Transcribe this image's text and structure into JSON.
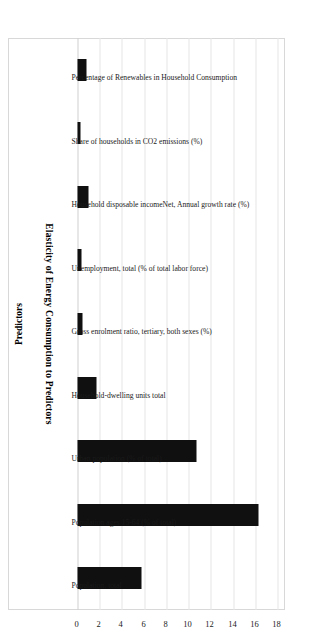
{
  "figure": {
    "caption": "Figure 10-7. Results of the elasticity analysis for Finland."
  },
  "chart_data": {
    "type": "bar",
    "orientation": "vertical-rotated",
    "title": "",
    "xlabel": "Predictors",
    "ylabel": "Elasticity of Energy Consumption  to Predictors",
    "ylim": [
      0,
      18
    ],
    "yticks": [
      0,
      2,
      4,
      6,
      8,
      10,
      12,
      14,
      16,
      18
    ],
    "grid": true,
    "legend": "none",
    "bar_color": "#101010",
    "categories": [
      "Percentage of Renewables in Household Consumption",
      "Share of households in CO2 emissions (%)",
      "Household disposable incomeNet, Annual growth rate (%)",
      "Unemployment, total (% of total labor force)",
      "Gross enrolment ratio, tertiary, both sexes (%)",
      "Household-dwelling units total",
      "Urban population (% of total)",
      "Population ages 15-64 (% of total)",
      "Population, total"
    ],
    "values": [
      0.85,
      0.25,
      0.95,
      0.35,
      0.45,
      1.75,
      10.7,
      16.3,
      5.8
    ]
  }
}
